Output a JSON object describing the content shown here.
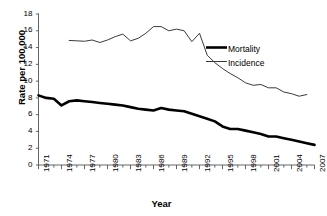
{
  "chart_data": {
    "type": "line",
    "title": "",
    "xlabel": "Year",
    "ylabel": "Rate per 100,000",
    "xlim": [
      1971,
      2007
    ],
    "ylim": [
      0,
      18
    ],
    "ytick_step": 2,
    "yticks": [
      0,
      2,
      4,
      6,
      8,
      10,
      12,
      14,
      16,
      18
    ],
    "xticks_labeled": [
      1971,
      1974,
      1977,
      1980,
      1983,
      1986,
      1989,
      1992,
      1995,
      1998,
      2001,
      2004,
      2007
    ],
    "xtick_interval_minor": 1,
    "grid": false,
    "legend_position": "upper-right-inside",
    "x": [
      1971,
      1972,
      1973,
      1974,
      1975,
      1976,
      1977,
      1978,
      1979,
      1980,
      1981,
      1982,
      1983,
      1984,
      1985,
      1986,
      1987,
      1988,
      1989,
      1990,
      1991,
      1992,
      1993,
      1994,
      1995,
      1996,
      1997,
      1998,
      1999,
      2000,
      2001,
      2002,
      2003,
      2004,
      2005,
      2006,
      2007
    ],
    "series": [
      {
        "name": "Mortality",
        "color": "#000000",
        "width": 2.6,
        "values": [
          8.3,
          8.0,
          7.9,
          7.1,
          7.6,
          7.7,
          7.6,
          7.5,
          7.4,
          7.3,
          7.2,
          7.1,
          6.9,
          6.7,
          6.6,
          6.5,
          6.8,
          6.6,
          6.5,
          6.4,
          6.1,
          5.8,
          5.5,
          5.2,
          4.6,
          4.3,
          4.3,
          4.1,
          3.9,
          3.7,
          3.4,
          3.4,
          3.2,
          3.0,
          2.8,
          2.6,
          2.4
        ]
      },
      {
        "name": "Incidence",
        "color": "#3a3a3a",
        "width": 1.0,
        "values": [
          null,
          null,
          null,
          null,
          14.85,
          14.8,
          14.75,
          14.9,
          14.6,
          14.9,
          15.3,
          15.6,
          14.8,
          15.1,
          15.7,
          16.5,
          16.5,
          16.0,
          16.2,
          16.0,
          14.7,
          15.7,
          13.1,
          12.2,
          11.5,
          10.9,
          10.4,
          9.8,
          9.5,
          9.6,
          9.2,
          9.2,
          8.7,
          8.5,
          8.2,
          8.4,
          null
        ]
      }
    ]
  },
  "legend": {
    "items": [
      {
        "label": "Mortality"
      },
      {
        "label": "Incidence"
      }
    ]
  }
}
